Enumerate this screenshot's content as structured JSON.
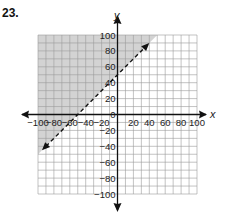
{
  "problem": {
    "number": "23."
  },
  "chart_data": {
    "type": "line",
    "title": "",
    "xlabel": "x",
    "ylabel": "y",
    "xlim": [
      -100,
      100
    ],
    "ylim": [
      -100,
      100
    ],
    "grid": true,
    "grid_step": 10,
    "x_ticks": [
      "-100",
      "-80",
      "-60",
      "-40",
      "-20",
      "20",
      "40",
      "60",
      "80",
      "100"
    ],
    "y_ticks": [
      "100",
      "80",
      "60",
      "40",
      "20",
      "0",
      "-20",
      "-40",
      "-60",
      "-80",
      "-100"
    ],
    "series": [
      {
        "name": "boundary",
        "equation": "y = x + 50",
        "style": "dashed",
        "x": [
          -95,
          40
        ],
        "y": [
          -45,
          90
        ],
        "arrows": "both"
      }
    ],
    "shaded_region": {
      "inequality": "y > x + 50",
      "color": "#d3d3d3",
      "side": "above-left of line"
    },
    "colors": {
      "grid": "#9a9a9a",
      "axis": "#111111",
      "shade": "#d3d3d3",
      "line": "#111111"
    }
  }
}
